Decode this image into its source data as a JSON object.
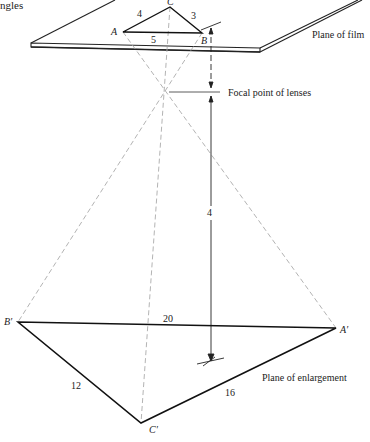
{
  "caption_fragment": "ngles",
  "film_plane": {
    "label": "Plane of film",
    "triangle": {
      "vertices": {
        "A": "A",
        "B": "B",
        "C": "C"
      },
      "sides": {
        "AC": "4",
        "CB": "3",
        "AB": "5"
      }
    }
  },
  "focal": {
    "label": "Focal point of lenses",
    "distance": "4"
  },
  "enlargement_plane": {
    "label": "Plane of enlargement",
    "triangle": {
      "vertices": {
        "A": "A′",
        "B": "B′",
        "C": "C′"
      },
      "sides": {
        "BA": "20",
        "BC": "12",
        "CA": "16"
      }
    }
  }
}
